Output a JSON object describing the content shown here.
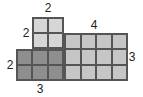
{
  "diagram": {
    "type": "grid-area-composite",
    "cell_size_px": 16,
    "blocks": [
      {
        "name": "top-block",
        "cols": 2,
        "rows": 2,
        "x": 32,
        "y": 17,
        "color": "#d6d6d6"
      },
      {
        "name": "right-block",
        "cols": 4,
        "rows": 3,
        "x": 64,
        "y": 33,
        "color": "#c6c6c6"
      },
      {
        "name": "bottom-left-block",
        "cols": 3,
        "rows": 2,
        "x": 16,
        "y": 49,
        "color": "#8e8e8e"
      }
    ],
    "labels": [
      {
        "name": "top-block-width-label",
        "text": "2",
        "x": 48,
        "y": 8
      },
      {
        "name": "top-block-height-label",
        "text": "2",
        "x": 26,
        "y": 33
      },
      {
        "name": "right-block-width-label",
        "text": "4",
        "x": 94,
        "y": 25
      },
      {
        "name": "right-block-height-label",
        "text": "3",
        "x": 132,
        "y": 57
      },
      {
        "name": "bottom-left-block-height-label",
        "text": "2",
        "x": 10,
        "y": 65
      },
      {
        "name": "bottom-left-block-width-label",
        "text": "3",
        "x": 40,
        "y": 89
      }
    ]
  }
}
